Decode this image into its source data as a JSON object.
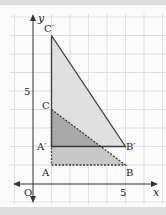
{
  "figure": {
    "axes": {
      "x_label": "x",
      "y_label": "y",
      "origin_label": "O",
      "x_tick_label": "5",
      "y_tick_label": "5"
    },
    "points": {
      "A": {
        "label": "A",
        "x": 1,
        "y": 1
      },
      "B": {
        "label": "B",
        "x": 5,
        "y": 1
      },
      "C": {
        "label": "C",
        "x": 1,
        "y": 4
      },
      "A_prime": {
        "label": "A′",
        "x": 1,
        "y": 2
      },
      "B_prime": {
        "label": "B′",
        "x": 5,
        "y": 2
      },
      "C_prime": {
        "label": "C′",
        "x": 1,
        "y": 8
      }
    },
    "colors": {
      "grid": "#d9d9d9",
      "axis": "#333333",
      "triangle_original_fill": "#c6c6c6",
      "triangle_image_fill": "#e0e0e0",
      "overlap_fill": "#a9a9a9",
      "stroke": "#3a3a3a"
    }
  }
}
